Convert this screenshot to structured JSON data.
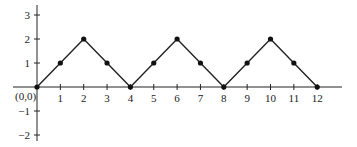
{
  "chart_data": {
    "type": "line",
    "title": "",
    "xlabel": "",
    "ylabel": "",
    "origin_label": "(0,0)",
    "x": [
      0,
      1,
      2,
      3,
      4,
      5,
      6,
      7,
      8,
      9,
      10,
      11,
      12
    ],
    "y": [
      0,
      1,
      2,
      1,
      0,
      1,
      2,
      1,
      0,
      1,
      2,
      1,
      0
    ],
    "x_ticks": [
      "1",
      "2",
      "3",
      "4",
      "5",
      "6",
      "7",
      "8",
      "9",
      "10",
      "11",
      "12"
    ],
    "y_ticks": [
      "3",
      "2",
      "1",
      "−1",
      "−2"
    ],
    "xlim": [
      -1,
      13
    ],
    "ylim": [
      -2,
      3
    ],
    "grid": false,
    "markers": true,
    "line_color": "#222222"
  }
}
